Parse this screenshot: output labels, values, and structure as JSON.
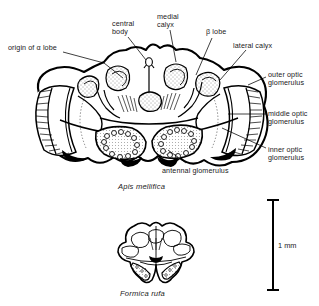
{
  "figure": {
    "background_color": "#ffffff",
    "ink_color": "#000000"
  },
  "labels": [
    {
      "id": "origin-alpha-lobe",
      "text": "origin of α lobe",
      "x": 8,
      "y": 44,
      "align": "left"
    },
    {
      "id": "central-body",
      "text": "central\nbody",
      "x": 112,
      "y": 20,
      "align": "left"
    },
    {
      "id": "medial-calyx",
      "text": "medial\ncalyx",
      "x": 157,
      "y": 13,
      "align": "left"
    },
    {
      "id": "beta-lobe",
      "text": "β lobe",
      "x": 206,
      "y": 28,
      "align": "left"
    },
    {
      "id": "lateral-calyx",
      "text": "lateral calyx",
      "x": 233,
      "y": 42,
      "align": "left"
    },
    {
      "id": "outer-optic",
      "text": "outer optic\nglomerulus",
      "x": 268,
      "y": 71,
      "align": "left"
    },
    {
      "id": "middle-optic",
      "text": "middle optic\nglomerulus",
      "x": 268,
      "y": 110,
      "align": "left"
    },
    {
      "id": "inner-optic",
      "text": "inner optic\nglomerulus",
      "x": 268,
      "y": 146,
      "align": "left"
    },
    {
      "id": "antennal-glomerulus",
      "text": "antennal glomerulus",
      "x": 162,
      "y": 167,
      "align": "left"
    }
  ],
  "captions": [
    {
      "id": "apis-mellifica",
      "text": "Apis mellifica",
      "x": 118,
      "y": 182
    },
    {
      "id": "formica-rufa",
      "text": "Formica rufa",
      "x": 120,
      "y": 289
    }
  ],
  "scale_bar": {
    "label": "1 mm",
    "label_x": 278,
    "label_y": 241,
    "bar_x": 273,
    "bar_top": 200,
    "bar_bottom": 290
  },
  "specimens": [
    {
      "id": "apis-brain",
      "species": "Apis mellifica",
      "view": "frontal section of brain"
    },
    {
      "id": "formica-brain",
      "species": "Formica rufa",
      "view": "frontal section of brain"
    }
  ]
}
